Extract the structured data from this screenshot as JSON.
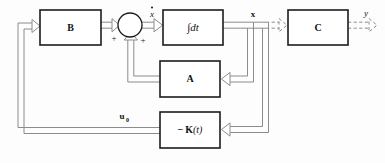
{
  "diagram": {
    "kind": "control-system-block-diagram",
    "background_color": "#fdfdfd",
    "line_color": "#8c8c8c",
    "box_border_color": "#1c1c1c",
    "text_color": "#111111",
    "blocks": [
      {
        "id": "B",
        "label": "B",
        "style": "bold",
        "x": 40,
        "y": 10,
        "w": 61,
        "h": 35
      },
      {
        "id": "INT",
        "label": "∫dt",
        "style": "italic",
        "x": 163,
        "y": 10,
        "w": 60,
        "h": 35
      },
      {
        "id": "C",
        "label": "C",
        "style": "bold",
        "x": 288,
        "y": 10,
        "w": 60,
        "h": 35
      },
      {
        "id": "A",
        "label": "A",
        "style": "bold",
        "x": 160,
        "y": 61,
        "w": 60,
        "h": 36
      },
      {
        "id": "K",
        "label": "− K(t)",
        "style": "bold-italic-arg",
        "x": 160,
        "y": 112,
        "w": 60,
        "h": 36
      }
    ],
    "summing_junction": {
      "id": "sum",
      "cx": 130,
      "cy": 25,
      "r": 12,
      "signs": [
        {
          "text": "+",
          "x": 114,
          "y": 39,
          "for": "input-from-B"
        },
        {
          "text": "+",
          "x": 143,
          "y": 41,
          "for": "input-from-A"
        }
      ]
    },
    "signal_labels": [
      {
        "id": "xdot",
        "text": "x",
        "accent": "dot",
        "x": 152,
        "y": 13,
        "style": "bold-italic"
      },
      {
        "id": "x",
        "text": "x",
        "accent": "none",
        "x": 253,
        "y": 14,
        "style": "bold"
      },
      {
        "id": "y",
        "text": "y",
        "accent": "none",
        "x": 366,
        "y": 13,
        "style": "bold-italic"
      },
      {
        "id": "u0",
        "text": "u",
        "accent": "none",
        "sub": "0",
        "x": 124,
        "y": 116,
        "style": "bold"
      }
    ],
    "connections": [
      {
        "id": "u0-to-B",
        "from": "u0-bus",
        "to": "B",
        "line": "solid",
        "arrow": true
      },
      {
        "id": "B-to-sum",
        "from": "B",
        "to": "sum",
        "line": "solid",
        "arrow": true
      },
      {
        "id": "sum-to-int",
        "from": "sum",
        "to": "INT",
        "line": "solid",
        "arrow": true,
        "label": "xdot"
      },
      {
        "id": "int-to-C",
        "from": "INT",
        "to": "C",
        "line": "dashed",
        "arrow": true,
        "label": "x"
      },
      {
        "id": "C-to-y",
        "from": "C",
        "to": "y",
        "line": "dashed",
        "arrow": true,
        "label": "y"
      },
      {
        "id": "x-to-A",
        "from": "x-bus",
        "to": "A",
        "line": "solid",
        "arrow": true
      },
      {
        "id": "A-to-sum",
        "from": "A",
        "to": "sum",
        "line": "solid",
        "arrow": true
      },
      {
        "id": "x-to-K",
        "from": "x-bus",
        "to": "K",
        "line": "solid",
        "arrow": true
      },
      {
        "id": "K-to-B",
        "from": "K",
        "to": "B",
        "line": "solid",
        "arrow": true,
        "label": "u0"
      }
    ]
  }
}
